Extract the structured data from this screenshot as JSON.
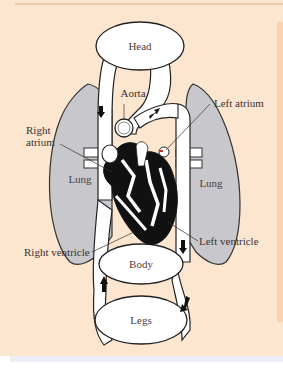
{
  "diagram": {
    "organs": {
      "head": "Head",
      "body": "Body",
      "legs": "Legs",
      "lung_left": "Lung",
      "lung_right": "Lung"
    },
    "labels": {
      "aorta": "Aorta",
      "left_atrium": "Left atrium",
      "right_atrium_line1": "Right",
      "right_atrium_line2": "atrium",
      "right_ventricle": "Right ventricle",
      "left_ventricle": "Left ventricle"
    },
    "colors": {
      "background": "#fde6cf",
      "lung": "#c8c8cc",
      "vessel": "#ffffff",
      "outline": "#222222",
      "heart": "#111111",
      "label_text": "#3a3130"
    }
  }
}
